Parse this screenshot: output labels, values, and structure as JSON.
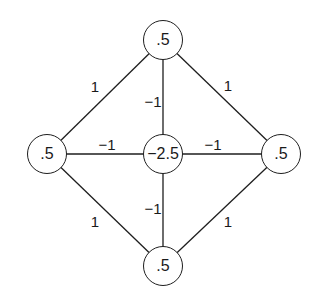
{
  "diagram": {
    "type": "weighted-graph",
    "colors": {
      "stroke": "#1e1e1e",
      "text": "#1a1a1a",
      "background": "#ffffff"
    },
    "nodes": [
      {
        "id": "top",
        "label": ".5",
        "x": 163,
        "y": 40,
        "r": 20
      },
      {
        "id": "left",
        "label": ".5",
        "x": 47,
        "y": 154,
        "r": 20
      },
      {
        "id": "center",
        "label": "−2.5",
        "x": 163,
        "y": 154,
        "r": 20
      },
      {
        "id": "right",
        "label": ".5",
        "x": 281,
        "y": 154,
        "r": 20
      },
      {
        "id": "bottom",
        "label": ".5",
        "x": 163,
        "y": 266,
        "r": 20
      }
    ],
    "edges": [
      {
        "from": "top",
        "to": "left",
        "weight": "1",
        "label_x": 95,
        "label_y": 86
      },
      {
        "from": "top",
        "to": "right",
        "weight": "1",
        "label_x": 228,
        "label_y": 85
      },
      {
        "from": "top",
        "to": "center",
        "weight": "−1",
        "label_x": 153,
        "label_y": 101
      },
      {
        "from": "left",
        "to": "center",
        "weight": "−1",
        "label_x": 107,
        "label_y": 144
      },
      {
        "from": "center",
        "to": "right",
        "weight": "−1",
        "label_x": 213,
        "label_y": 144
      },
      {
        "from": "center",
        "to": "bottom",
        "weight": "−1",
        "label_x": 153,
        "label_y": 208
      },
      {
        "from": "left",
        "to": "bottom",
        "weight": "1",
        "label_x": 95,
        "label_y": 221
      },
      {
        "from": "right",
        "to": "bottom",
        "weight": "1",
        "label_x": 228,
        "label_y": 221
      }
    ]
  }
}
